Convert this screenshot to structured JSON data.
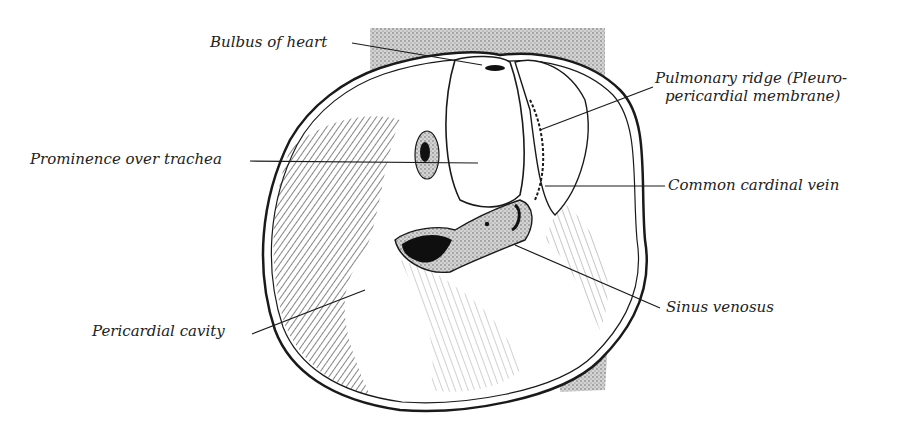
{
  "figure": {
    "labels": {
      "bulbus": "Bulbus of heart",
      "pulmonary_line1": "Pulmonary ridge (Pleuro-",
      "pulmonary_line2": "pericardial membrane)",
      "prominence": "Prominence over trachea",
      "cardinal": "Common cardinal vein",
      "sinus": "Sinus venosus",
      "pericardial": "Pericardial cavity"
    },
    "colors": {
      "ink": "#1a1a1a",
      "stipple": "#9a9a9a",
      "background": "#ffffff"
    }
  }
}
